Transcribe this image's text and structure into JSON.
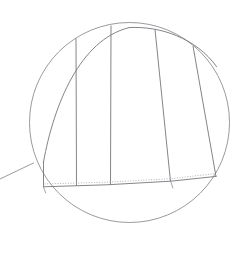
{
  "figure": {
    "title": "",
    "kind": "technical-drawing-detail-callout",
    "canvas": {
      "width": 244,
      "height": 263,
      "background": "#ffffff"
    },
    "colors": {
      "line": "#76767c",
      "line_light": "#9a9aa0",
      "circle": "#8e8e94",
      "dotted": "#a9a9af",
      "background": "#ffffff"
    },
    "detail_circle": {
      "label": "",
      "center_x": 129.5,
      "center_y": 122.5,
      "radius": 100,
      "stroke_width": 0.9
    },
    "leader_line": {
      "label": "",
      "x1": 0,
      "y1": 179,
      "x2": 33.5,
      "y2": 163,
      "stroke_width": 0.9
    },
    "panel_outline": {
      "label": "panel-assembly",
      "top_edge": "M 43.5 162 C 60 86, 86 38, 129 28 C 162 26, 196 38, 216 66",
      "bottom_solid": "M 43.5 186.5 L 106.5 184.6 L 170.5 181.0 L 216.0 176.0",
      "bottom_dotted": "M 44.5 183.8 L 107 182.2 L 170.5 178.6 L 214.5 173.6",
      "stroke_width": 0.9
    },
    "seam_lines": [
      {
        "label": "seam-1",
        "x1": 43.5,
        "y1": 161.5,
        "x2": 43.5,
        "y2": 186.8
      },
      {
        "label": "seam-2",
        "x1": 76.0,
        "y1": 38.5,
        "x2": 76.5,
        "y2": 185.6
      },
      {
        "label": "seam-3",
        "x1": 111.0,
        "y1": 25.5,
        "x2": 110.5,
        "y2": 184.6
      },
      {
        "label": "seam-4",
        "x1": 155.0,
        "y1": 29.5,
        "x2": 170.5,
        "y2": 181.5
      },
      {
        "label": "seam-5",
        "x1": 193.0,
        "y1": 46.0,
        "x2": 216.0,
        "y2": 176.5
      }
    ],
    "segment_edges": [
      {
        "label": "edge-left-bottom-tick",
        "x1": 43.5,
        "y1": 186.6,
        "x2": 45.5,
        "y2": 192.5
      },
      {
        "label": "edge-right-bottom-tick",
        "x1": 170.8,
        "y1": 181.2,
        "x2": 172.5,
        "y2": 188.0
      }
    ]
  }
}
